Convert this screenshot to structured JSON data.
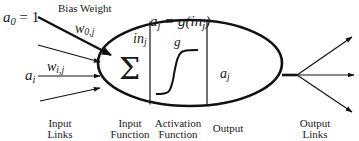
{
  "diagram": {
    "type": "neuron-model",
    "colors": {
      "stroke": "#111111",
      "text": "#1a1a1a",
      "background": "#ffffff"
    },
    "labels": {
      "bias_input": "a",
      "bias_input_sub": "0",
      "bias_input_eq": " = 1",
      "bias_title": "Bias Weight",
      "bias_weight": "w",
      "bias_weight_sub": "0,j",
      "input_weight": "w",
      "input_weight_sub": "i,j",
      "input": "a",
      "input_sub": "i",
      "activation_eq_lhs": "a",
      "activation_eq_lhs_sub": "j",
      "activation_eq_rhs": " = g(in",
      "activation_eq_rhs_sub": "j",
      "activation_eq_close": ")",
      "sum_symbol": "Σ",
      "net_input": "in",
      "net_input_sub": "j",
      "activation_fn": "g",
      "output": "a",
      "output_sub": "j"
    },
    "captions": {
      "input_links": [
        "Input",
        "Links"
      ],
      "input_function": [
        "Input",
        "Function"
      ],
      "activation_function": [
        "Activation",
        "Function"
      ],
      "output": [
        "Output"
      ],
      "output_links": [
        "Output",
        "Links"
      ]
    }
  }
}
